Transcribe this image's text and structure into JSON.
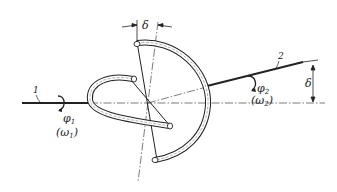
{
  "diagram": {
    "labels": {
      "shaft1_number": "1",
      "shaft2_number": "2",
      "phi1": "φ",
      "phi1_sub": "1",
      "omega1": "(ω",
      "omega1_sub": "1",
      "omega1_close": ")",
      "phi2": "φ",
      "phi2_sub": "2",
      "omega2": "(ω",
      "omega2_sub": "2",
      "omega2_close": ")",
      "delta_top": "δ",
      "delta_right": "δ"
    },
    "colors": {
      "line": "#222222",
      "background": "#ffffff"
    }
  }
}
